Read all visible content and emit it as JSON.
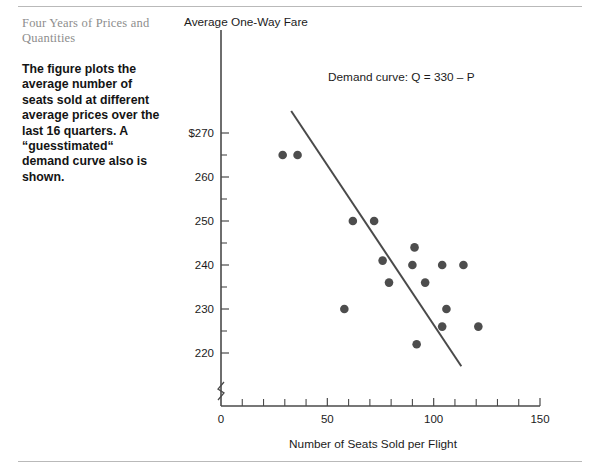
{
  "caption": {
    "title": "Four Years of Prices and Quantities",
    "body": "The figure plots the average number of seats sold at different average prices over the last 16 quarters. A “guesstimated“ demand curve also is shown."
  },
  "chart_data": {
    "type": "scatter",
    "title": "",
    "ylabel": "Average One-Way Fare",
    "xlabel": "Number of Seats Sold per Flight",
    "xlim": [
      0,
      150
    ],
    "ylim": [
      215,
      275
    ],
    "grid": false,
    "legend": null,
    "x_ticks_major": [
      0,
      50,
      100,
      150
    ],
    "x_tick_labels": [
      "0",
      "50",
      "100",
      "150"
    ],
    "x_ticks_minor": [
      10,
      20,
      30,
      40,
      60,
      70,
      80,
      90,
      110,
      120,
      130,
      140
    ],
    "y_ticks_major": [
      270,
      260,
      250,
      240,
      230,
      220
    ],
    "y_tick_labels": [
      "$270",
      "260",
      "250",
      "240",
      "230",
      "220"
    ],
    "y_ticks_minor": [
      265,
      255,
      245,
      235,
      225
    ],
    "y_axis_break": true,
    "points": [
      {
        "x": 29,
        "y": 265
      },
      {
        "x": 36,
        "y": 265
      },
      {
        "x": 62,
        "y": 250
      },
      {
        "x": 72,
        "y": 250
      },
      {
        "x": 91,
        "y": 244
      },
      {
        "x": 76,
        "y": 241
      },
      {
        "x": 90,
        "y": 240
      },
      {
        "x": 104,
        "y": 240
      },
      {
        "x": 114,
        "y": 240
      },
      {
        "x": 79,
        "y": 236
      },
      {
        "x": 96,
        "y": 236
      },
      {
        "x": 58,
        "y": 230
      },
      {
        "x": 106,
        "y": 230
      },
      {
        "x": 104,
        "y": 226
      },
      {
        "x": 121,
        "y": 226
      },
      {
        "x": 92,
        "y": 222
      }
    ],
    "annotations": [
      {
        "name": "demand-curve-label",
        "text": "Demand curve: Q = 330 – P"
      }
    ],
    "demand_line": {
      "equation": "Q = 330 - P",
      "from": {
        "x": 33,
        "y": 275
      },
      "to": {
        "x": 113,
        "y": 217
      }
    }
  }
}
